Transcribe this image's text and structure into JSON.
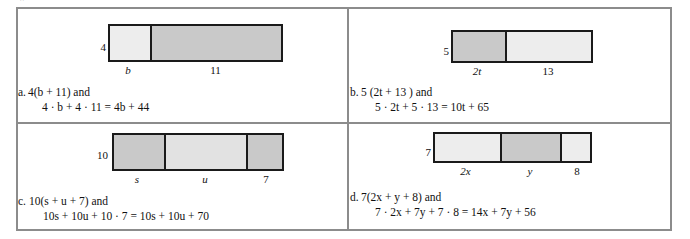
{
  "page": {
    "stray_mark": "''",
    "width": 690,
    "height": 239
  },
  "colors": {
    "frame_border": "#8c8c8c",
    "bar_border": "#1a1a1a",
    "segment_light": "#ededed",
    "segment_mid": "#e2e2e2",
    "segment_dark": "#c9c9c9",
    "text": "#111111",
    "background": "#ffffff"
  },
  "items": [
    {
      "key": "a",
      "marker": "a.",
      "diagram": {
        "height_label": "4",
        "segments": [
          {
            "label": "b",
            "label_italic": true,
            "shade": "light",
            "width": 40
          },
          {
            "label": "11",
            "label_italic": false,
            "shade": "dark",
            "width": 131
          }
        ]
      },
      "expression_line1": "4(b + 11)  and",
      "expression_line2": "4 · b  +  4 · 11 = 4b  +  44"
    },
    {
      "key": "b",
      "marker": "b.",
      "diagram": {
        "height_label": "5",
        "segments": [
          {
            "label": "2t",
            "label_italic": true,
            "shade": "dark",
            "width": 52
          },
          {
            "label": "13",
            "label_italic": false,
            "shade": "light",
            "width": 86
          }
        ]
      },
      "expression_line1": "5 (2t + 13 )  and",
      "expression_line2": "5 · 2t + 5 · 13 = 10t + 65"
    },
    {
      "key": "c",
      "marker": "c.",
      "diagram": {
        "height_label": "10",
        "segments": [
          {
            "label": "s",
            "label_italic": true,
            "shade": "dark",
            "width": 50
          },
          {
            "label": "u",
            "label_italic": true,
            "shade": "mid",
            "width": 82
          },
          {
            "label": "7",
            "label_italic": false,
            "shade": "dark",
            "width": 36
          }
        ]
      },
      "expression_line1": "10(s + u + 7)  and",
      "expression_line2": "10s + 10u + 10 · 7 = 10s + 10u + 70"
    },
    {
      "key": "d",
      "marker": "d.",
      "diagram": {
        "height_label": "7",
        "segments": [
          {
            "label": "2x",
            "label_italic": true,
            "shade": "light",
            "width": 65
          },
          {
            "label": "y",
            "label_italic": true,
            "shade": "dark",
            "width": 60
          },
          {
            "label": "8",
            "label_italic": false,
            "shade": "light",
            "width": 30
          }
        ]
      },
      "expression_line1": "7(2x + y + 8)  and",
      "expression_line2": "7 · 2x + 7y + 7 · 8 = 14x + 7y + 56"
    }
  ]
}
